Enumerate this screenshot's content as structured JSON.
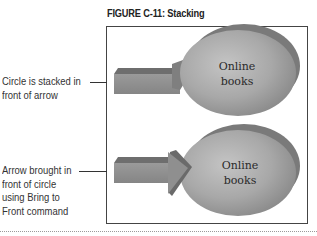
{
  "figure": {
    "title": "FIGURE C-11: Stacking"
  },
  "callouts": [
    {
      "lines": [
        "Circle is stacked in",
        "front of arrow"
      ]
    },
    {
      "lines": [
        "Arrow brought in",
        "front of circle",
        "using Bring to",
        "Front command"
      ]
    }
  ],
  "examples": [
    {
      "oval_label": [
        "Online",
        "books"
      ],
      "stacking": "circle-in-front"
    },
    {
      "oval_label": [
        "Online",
        "books"
      ],
      "stacking": "arrow-in-front"
    }
  ],
  "colors": {
    "oval_light": "#b8b8b8",
    "oval_dark": "#7a7a7a",
    "arrow_face": "#8f8f8f",
    "arrow_top": "#6e6e6e",
    "frame_border": "#444444"
  }
}
